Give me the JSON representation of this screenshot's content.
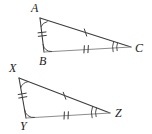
{
  "figure": {
    "background_color": "#ffffff",
    "stroke_color": "#3c3c3c",
    "mark_color": "#3c3c3c",
    "label_color": "#1a1a1a",
    "width": 152,
    "height": 134
  },
  "triangles": [
    {
      "name": "triangle-abc",
      "vertices": [
        {
          "label": "A",
          "x": 40,
          "y": 18,
          "label_x": 31,
          "label_y": 2
        },
        {
          "label": "B",
          "x": 44,
          "y": 52,
          "label_x": 39,
          "label_y": 55
        },
        {
          "label": "C",
          "x": 131,
          "y": 47,
          "label_x": 135,
          "label_y": 42
        }
      ],
      "sides": [
        {
          "name": "side-ab",
          "from": "A",
          "to": "B",
          "ticks": 2
        },
        {
          "name": "side-ac",
          "from": "A",
          "to": "C",
          "ticks": 1
        },
        {
          "name": "side-bc",
          "from": "B",
          "to": "C",
          "ticks": 2
        }
      ],
      "angles": [
        {
          "name": "angle-a",
          "at": "A",
          "arcs": 1
        },
        {
          "name": "angle-b",
          "at": "B",
          "arcs": 1
        },
        {
          "name": "angle-c",
          "at": "C",
          "arcs": 2
        }
      ]
    },
    {
      "name": "triangle-xyz",
      "vertices": [
        {
          "label": "X",
          "x": 19,
          "y": 78,
          "label_x": 9,
          "label_y": 62
        },
        {
          "label": "Y",
          "x": 26,
          "y": 118,
          "label_x": 20,
          "label_y": 120
        },
        {
          "label": "Z",
          "x": 110,
          "y": 113,
          "label_x": 115,
          "label_y": 107
        }
      ],
      "sides": [
        {
          "name": "side-xy",
          "from": "X",
          "to": "Y",
          "ticks": 2
        },
        {
          "name": "side-xz",
          "from": "X",
          "to": "Z",
          "ticks": 1
        },
        {
          "name": "side-yz",
          "from": "Y",
          "to": "Z",
          "ticks": 2
        }
      ],
      "angles": [
        {
          "name": "angle-x",
          "at": "X",
          "arcs": 1
        },
        {
          "name": "angle-y",
          "at": "Y",
          "arcs": 1
        },
        {
          "name": "angle-z",
          "at": "Z",
          "arcs": 2
        }
      ]
    }
  ]
}
